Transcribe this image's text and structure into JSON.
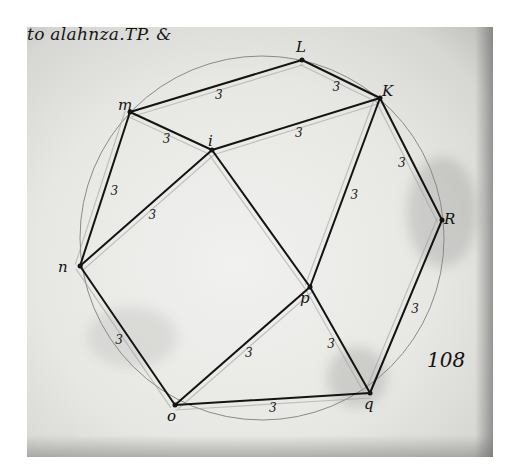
{
  "document": {
    "type": "manuscript geometric diagram (scanned page)",
    "heading": "to alahnza.TP. &",
    "folio_number": "108",
    "colors": {
      "ink": "#141414",
      "paper": "#e9e9e6",
      "background": "#ffffff"
    }
  },
  "vertices": [
    {
      "id": "L",
      "label": "L",
      "x": 302,
      "y": 60
    },
    {
      "id": "K",
      "label": "K",
      "x": 380,
      "y": 98
    },
    {
      "id": "m",
      "label": "m",
      "x": 130,
      "y": 112
    },
    {
      "id": "i",
      "label": "i",
      "x": 212,
      "y": 150
    },
    {
      "id": "R",
      "label": "R",
      "x": 442,
      "y": 220
    },
    {
      "id": "n",
      "label": "n",
      "x": 80,
      "y": 266
    },
    {
      "id": "p",
      "label": "p",
      "x": 310,
      "y": 287
    },
    {
      "id": "o",
      "label": "o",
      "x": 175,
      "y": 405
    },
    {
      "id": "q",
      "label": "q",
      "x": 370,
      "y": 393
    }
  ],
  "edges": [
    {
      "from": "m",
      "to": "L",
      "length_label": "3"
    },
    {
      "from": "L",
      "to": "K",
      "length_label": "3"
    },
    {
      "from": "m",
      "to": "i",
      "length_label": "3"
    },
    {
      "from": "i",
      "to": "K",
      "length_label": "3"
    },
    {
      "from": "m",
      "to": "n",
      "length_label": "3"
    },
    {
      "from": "n",
      "to": "i",
      "length_label": "3"
    },
    {
      "from": "K",
      "to": "R",
      "length_label": "3"
    },
    {
      "from": "K",
      "to": "p",
      "length_label": "3"
    },
    {
      "from": "i",
      "to": "p",
      "length_label": ""
    },
    {
      "from": "R",
      "to": "q",
      "length_label": "3"
    },
    {
      "from": "n",
      "to": "o",
      "length_label": "3"
    },
    {
      "from": "o",
      "to": "p",
      "length_label": "3"
    },
    {
      "from": "p",
      "to": "q",
      "length_label": "3"
    },
    {
      "from": "o",
      "to": "q",
      "length_label": "3"
    }
  ],
  "circumcircle": {
    "cx": 262,
    "cy": 238,
    "r": 182
  }
}
